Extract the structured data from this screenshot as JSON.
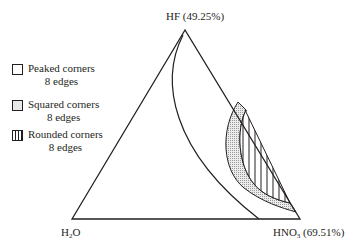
{
  "diagram": {
    "type": "ternary-phase-diagram",
    "vertices": {
      "top": {
        "label": "HF (49.25%)"
      },
      "bottom_left": {
        "label_main": "H",
        "label_sub": "2",
        "label_end": "O"
      },
      "bottom_right": {
        "label_main": "HNO",
        "label_sub": "3",
        "label_end": " (69.51%)"
      }
    },
    "legend": [
      {
        "pattern": "empty",
        "line1": "Peaked corners",
        "line2": "8 edges"
      },
      {
        "pattern": "dotted",
        "line1": "Squared corners",
        "line2": "8 edges"
      },
      {
        "pattern": "vertical-lines",
        "line1": "Rounded corners",
        "line2": "8 edges"
      }
    ],
    "colors": {
      "stroke": "#231f20",
      "dotted_fill": "#e0e0e0",
      "background": "#ffffff"
    }
  }
}
